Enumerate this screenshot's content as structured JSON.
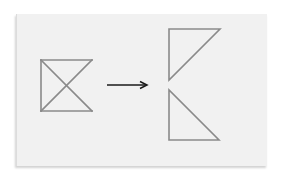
{
  "diagram": {
    "colors": {
      "background": "#ffffff",
      "card": "#f1f1f1",
      "shape_stroke": "#8a8a8a",
      "arrow_stroke": "#1a1a1a"
    },
    "source_shape": {
      "points": {
        "tl": [
          41,
          60
        ],
        "tr": [
          92,
          60
        ],
        "bl": [
          41,
          111
        ],
        "br": [
          92,
          111
        ]
      },
      "edges": [
        "top",
        "left",
        "bottom",
        "diagonal-tl-br",
        "diagonal-tr-bl"
      ]
    },
    "arrow": {
      "from": [
        107,
        85
      ],
      "to": [
        147,
        85
      ],
      "direction": "right"
    },
    "result_shapes": [
      {
        "name": "upper-triangle",
        "points": [
          [
            169,
            29
          ],
          [
            220,
            29
          ],
          [
            169,
            80
          ]
        ]
      },
      {
        "name": "lower-triangle",
        "points": [
          [
            169,
            90
          ],
          [
            169,
            140
          ],
          [
            219,
            140
          ]
        ]
      }
    ]
  }
}
